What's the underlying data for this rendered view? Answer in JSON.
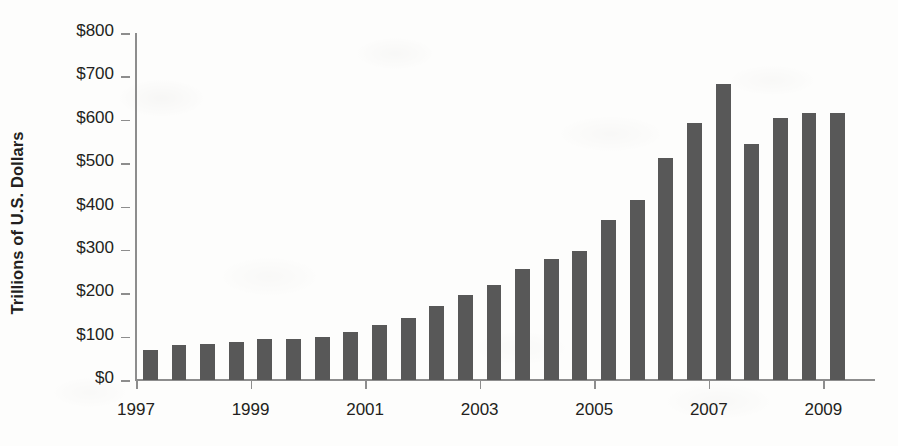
{
  "chart_data": {
    "type": "bar",
    "title": "",
    "xlabel": "",
    "ylabel": "Trillions of U.S. Dollars",
    "ylim": [
      0,
      800
    ],
    "y_tick_interval": 100,
    "y_ticks": [
      0,
      100,
      200,
      300,
      400,
      500,
      600,
      700,
      800
    ],
    "y_tick_labels": [
      "$0",
      "$100",
      "$200",
      "$300",
      "$400",
      "$500",
      "$600",
      "$700",
      "$800"
    ],
    "x_tick_labels": [
      "1997",
      "1999",
      "2001",
      "2003",
      "2005",
      "2007",
      "2009"
    ],
    "x_tick_values": [
      1997,
      1999,
      2001,
      2003,
      2005,
      2007,
      2009
    ],
    "xlim": [
      1997,
      2009.5
    ],
    "grid": false,
    "legend": false,
    "bar_color": "#585858",
    "axis_color": "#8d8d8d",
    "text_color": "#231f20",
    "period": "semiannual",
    "categories": [
      "1997 H1",
      "1997 H2",
      "1998 H1",
      "1998 H2",
      "1999 H1",
      "1999 H2",
      "2000 H1",
      "2000 H2",
      "2001 H1",
      "2001 H2",
      "2002 H1",
      "2002 H2",
      "2003 H1",
      "2003 H2",
      "2004 H1",
      "2004 H2",
      "2005 H1",
      "2005 H2",
      "2006 H1",
      "2006 H2",
      "2007 H1",
      "2007 H2",
      "2008 H1",
      "2008 H2",
      "2009 H1"
    ],
    "x": [
      1997.25,
      1997.75,
      1998.25,
      1998.75,
      1999.25,
      1999.75,
      2000.25,
      2000.75,
      2001.25,
      2001.75,
      2002.25,
      2002.75,
      2003.25,
      2003.75,
      2004.25,
      2004.75,
      2005.25,
      2005.75,
      2006.25,
      2006.75,
      2007.25,
      2007.75,
      2008.25,
      2008.75,
      2009.25
    ],
    "values": [
      70,
      80,
      82,
      88,
      94,
      95,
      99,
      111,
      127,
      142,
      170,
      197,
      220,
      257,
      280,
      297,
      370,
      415,
      513,
      592,
      683,
      545,
      604,
      615,
      615
    ]
  },
  "axis": {
    "y_title": "Trillions of U.S. Dollars"
  }
}
